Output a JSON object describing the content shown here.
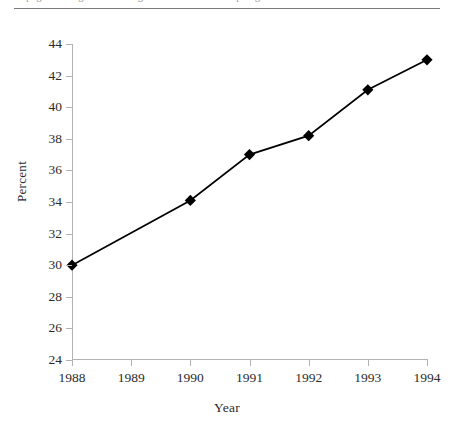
{
  "artifact": {
    "clipped_caption": "the page heading above the figure is cut off at the top edge of the scan"
  },
  "chart_data": {
    "type": "line",
    "title": "",
    "xlabel": "Year",
    "ylabel": "Percent",
    "x": [
      1988,
      1989,
      1990,
      1991,
      1992,
      1993,
      1994
    ],
    "xtick_labels": [
      "1988",
      "1989",
      "1990",
      "1991",
      "1992",
      "1993",
      "1994"
    ],
    "xlim": [
      1988,
      1994
    ],
    "ylim": [
      24,
      44
    ],
    "ytick_labels": [
      "24",
      "26",
      "28",
      "30",
      "32",
      "34",
      "36",
      "38",
      "40",
      "42",
      "44"
    ],
    "yticks": [
      24,
      26,
      28,
      30,
      32,
      34,
      36,
      38,
      40,
      42,
      44
    ],
    "grid": false,
    "legend": null,
    "marker": "diamond",
    "line_color": "#000000",
    "marker_color": "#000000",
    "axis_color": "#b2b2b2",
    "points": [
      {
        "x": 1988,
        "y": 30.0,
        "marker": true
      },
      {
        "x": 1990,
        "y": 34.1,
        "marker": true
      },
      {
        "x": 1991,
        "y": 37.0,
        "marker": true
      },
      {
        "x": 1992,
        "y": 38.2,
        "marker": true
      },
      {
        "x": 1993,
        "y": 41.1,
        "marker": true
      },
      {
        "x": 1994,
        "y": 43.0,
        "marker": true
      }
    ],
    "series": [
      {
        "name": "Percent",
        "x": [
          1988,
          1990,
          1991,
          1992,
          1993,
          1994
        ],
        "values": [
          30.0,
          34.1,
          37.0,
          38.2,
          41.1,
          43.0
        ]
      }
    ]
  }
}
